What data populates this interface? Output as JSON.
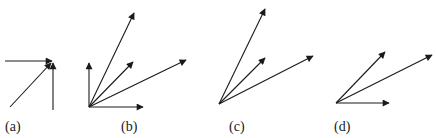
{
  "panels": [
    {
      "id": "a",
      "label": "(a)"
    },
    {
      "id": "b",
      "label": "(b)"
    },
    {
      "id": "c",
      "label": "(c)"
    },
    {
      "id": "d",
      "label": "(d)"
    }
  ],
  "colors": {
    "ink": "#1a1a1a",
    "background": "#ffffff"
  }
}
